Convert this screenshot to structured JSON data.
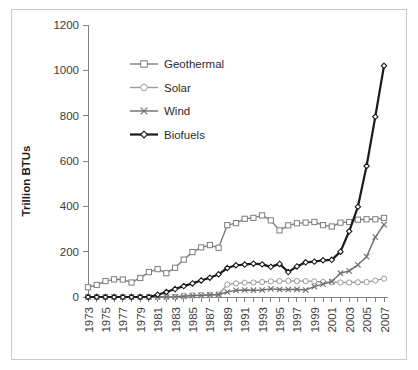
{
  "figure": {
    "y_axis_title": "Trillion BTUs",
    "has_outer_frame": true
  },
  "legend": {
    "position": "upper-left-inside",
    "items": [
      {
        "label": "Geothermal",
        "marker": "square-marker-icon",
        "color": "#7d7d7d"
      },
      {
        "label": "Solar",
        "marker": "circle-marker-icon",
        "color": "#9a9a9a"
      },
      {
        "label": "Wind",
        "marker": "cross-marker-icon",
        "color": "#6e6e6e"
      },
      {
        "label": "Biofuels",
        "marker": "diamond-marker-icon",
        "color": "#1a1a1a"
      }
    ]
  },
  "chart_data": {
    "type": "line",
    "title": "",
    "xlabel": "",
    "ylabel": "Trillion BTUs",
    "ylim": [
      0,
      1200
    ],
    "ytick_labels": [
      "0",
      "200",
      "400",
      "600",
      "800",
      "1000",
      "1200"
    ],
    "ytick_values": [
      0,
      200,
      400,
      600,
      800,
      1000,
      1200
    ],
    "grid": false,
    "legend_position": "upper left",
    "x": [
      1973,
      1974,
      1975,
      1976,
      1977,
      1978,
      1979,
      1980,
      1981,
      1982,
      1983,
      1984,
      1985,
      1986,
      1987,
      1988,
      1989,
      1990,
      1991,
      1992,
      1993,
      1994,
      1995,
      1996,
      1997,
      1998,
      1999,
      2000,
      2001,
      2002,
      2003,
      2004,
      2005,
      2006,
      2007
    ],
    "xtick_labels": [
      "1973",
      "",
      "1975",
      "",
      "1977",
      "",
      "1979",
      "",
      "1981",
      "",
      "1983",
      "",
      "1985",
      "",
      "1987",
      "",
      "1989",
      "",
      "1991",
      "",
      "1993",
      "",
      "1995",
      "",
      "1997",
      "",
      "1999",
      "",
      "2001",
      "",
      "2003",
      "",
      "2005",
      "",
      "2007"
    ],
    "xtick_labels_visible": [
      "1973",
      "1975",
      "1977",
      "1979",
      "1981",
      "1983",
      "1985",
      "1987",
      "1989",
      "1991",
      "1993",
      "1995",
      "1997",
      "1999",
      "2001",
      "2003",
      "2005",
      "2007"
    ],
    "xtick_rotation": 90,
    "series": [
      {
        "name": "Geothermal",
        "color": "#7d7d7d",
        "marker": "square",
        "line_width": 1.4,
        "values": [
          43,
          53,
          70,
          78,
          77,
          64,
          84,
          110,
          123,
          105,
          129,
          165,
          198,
          219,
          229,
          217,
          317,
          326,
          345,
          349,
          360,
          338,
          294,
          316,
          325,
          328,
          331,
          317,
          311,
          328,
          331,
          341,
          343,
          343,
          349
        ]
      },
      {
        "name": "Solar",
        "color": "#9a9a9a",
        "marker": "circle",
        "line_width": 1.4,
        "values": [
          0,
          0,
          0,
          0,
          0,
          0,
          0,
          0,
          0,
          0,
          0,
          6,
          8,
          9,
          10,
          11,
          55,
          60,
          63,
          64,
          66,
          69,
          70,
          71,
          70,
          70,
          69,
          66,
          65,
          64,
          64,
          65,
          66,
          72,
          81
        ]
      },
      {
        "name": "Wind",
        "color": "#6e6e6e",
        "marker": "cross",
        "line_width": 1.4,
        "values": [
          0,
          0,
          0,
          0,
          0,
          0,
          0,
          0,
          0,
          0,
          1,
          3,
          6,
          7,
          9,
          11,
          22,
          29,
          31,
          30,
          31,
          36,
          33,
          33,
          34,
          31,
          46,
          57,
          68,
          105,
          115,
          142,
          178,
          264,
          319
        ]
      },
      {
        "name": "Biofuels",
        "color": "#1a1a1a",
        "marker": "diamond",
        "line_width": 2.2,
        "values": [
          0,
          0,
          0,
          0,
          0,
          0,
          0,
          0,
          10,
          22,
          35,
          48,
          60,
          73,
          85,
          100,
          128,
          140,
          143,
          147,
          144,
          133,
          146,
          110,
          135,
          153,
          156,
          162,
          164,
          200,
          290,
          398,
          578,
          795,
          1020
        ]
      }
    ]
  }
}
